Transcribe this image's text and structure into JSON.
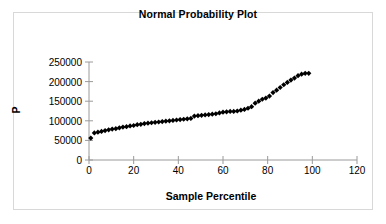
{
  "chart_data": {
    "type": "scatter",
    "title": "Normal Probability Plot",
    "xlabel": "Sample Percentile",
    "ylabel": "P",
    "xlim": [
      0,
      120
    ],
    "ylim": [
      0,
      250000
    ],
    "xticks": [
      0,
      20,
      40,
      60,
      80,
      100,
      120
    ],
    "yticks": [
      0,
      50000,
      100000,
      150000,
      200000,
      250000
    ],
    "xtick_labels": [
      "0",
      "20",
      "40",
      "60",
      "80",
      "100",
      "120"
    ],
    "ytick_labels": [
      "0",
      "50000",
      "100000",
      "150000",
      "200000",
      "250000"
    ],
    "grid": false,
    "legend": false,
    "marker": "diamond",
    "marker_color": "#000000",
    "series": [
      {
        "name": "P",
        "x": [
          0.8,
          2.4,
          4.0,
          5.6,
          7.2,
          8.8,
          10.4,
          12.0,
          13.6,
          15.2,
          16.8,
          18.4,
          20.0,
          21.6,
          23.2,
          24.8,
          26.4,
          28.0,
          29.6,
          31.2,
          32.8,
          34.4,
          36.0,
          37.6,
          39.2,
          40.8,
          42.4,
          44.0,
          45.6,
          47.2,
          48.8,
          50.4,
          52.0,
          53.6,
          55.2,
          56.8,
          58.4,
          60.0,
          61.6,
          63.2,
          64.8,
          66.4,
          68.0,
          69.6,
          71.2,
          72.8,
          74.4,
          76.0,
          77.6,
          79.2,
          80.8,
          82.4,
          84.0,
          85.6,
          87.2,
          88.8,
          90.4,
          92.0,
          93.6,
          95.2,
          96.8,
          98.4
        ],
        "y": [
          56000,
          69000,
          71000,
          73000,
          75000,
          77000,
          79000,
          80000,
          82000,
          84000,
          85000,
          87000,
          88000,
          90000,
          91000,
          93000,
          94000,
          95000,
          96000,
          97000,
          98000,
          99000,
          100000,
          101000,
          102000,
          103000,
          104000,
          105000,
          106000,
          112000,
          113000,
          114000,
          115000,
          116000,
          117000,
          118000,
          120000,
          122000,
          123000,
          124000,
          124000,
          125000,
          127000,
          129000,
          132000,
          136000,
          145000,
          150000,
          155000,
          158000,
          163000,
          172000,
          178000,
          185000,
          192000,
          198000,
          204000,
          209000,
          215000,
          219000,
          221000,
          221000
        ]
      }
    ]
  },
  "axes": {
    "title": "Normal Probability Plot",
    "x_axis_label": "Sample Percentile",
    "y_axis_label": "P"
  }
}
